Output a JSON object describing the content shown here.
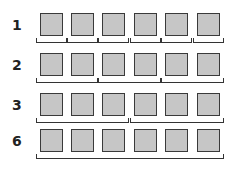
{
  "diagram": {
    "colors": {
      "square_fill": "#c6c6c6",
      "square_border": "#3a3a3a",
      "bracket": "#333333"
    },
    "squares_per_row": 6,
    "rows": [
      {
        "label": "1",
        "group_size": 1,
        "top": 13
      },
      {
        "label": "2",
        "group_size": 2,
        "top": 53
      },
      {
        "label": "3",
        "group_size": 3,
        "top": 93
      },
      {
        "label": "6",
        "group_size": 6,
        "top": 129
      }
    ]
  }
}
